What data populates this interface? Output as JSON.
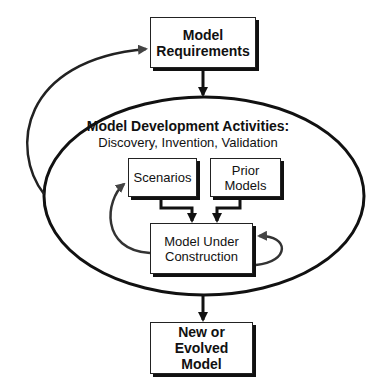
{
  "diagram": {
    "nodes": {
      "requirements": {
        "line1": "Model",
        "line2": "Requirements"
      },
      "container": {
        "title": "Model Development Activities:",
        "subtitle": "Discovery, Invention, Validation"
      },
      "scenarios": {
        "line1": "Scenarios"
      },
      "prior_models": {
        "line1": "Prior",
        "line2": "Models"
      },
      "under_construction": {
        "line1": "Model Under",
        "line2": "Construction"
      },
      "output": {
        "line1": "New or Evolved",
        "line2": "Model"
      }
    },
    "edges": [
      {
        "from": "requirements",
        "to": "container"
      },
      {
        "from": "container",
        "to": "requirements",
        "style": "feedback-loop"
      },
      {
        "from": "scenarios",
        "to": "under_construction"
      },
      {
        "from": "prior_models",
        "to": "under_construction"
      },
      {
        "from": "under_construction",
        "to": "scenarios",
        "style": "feedback-loop"
      },
      {
        "from": "under_construction",
        "to": "under_construction",
        "style": "self-loop"
      },
      {
        "from": "container",
        "to": "output"
      }
    ]
  }
}
